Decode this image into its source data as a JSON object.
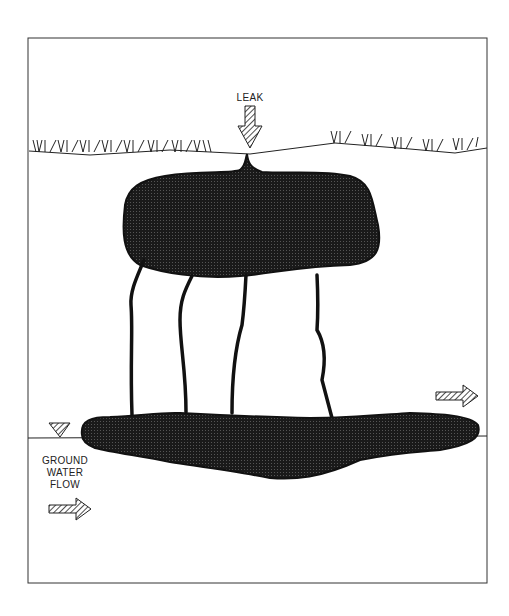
{
  "diagram": {
    "labels": {
      "leak": "LEAK",
      "ground_water_flow": [
        "GROUND",
        "WATER",
        "FLOW"
      ]
    },
    "elements": {
      "leak_arrow": "down-arrow-hatched",
      "upper_plume": "contaminant-pool-vadose-zone",
      "fingers": 4,
      "lower_plume": "contaminant-pool-water-table",
      "water_table_symbol": "inverted-triangle-hatched",
      "flow_arrows": 2
    },
    "colors": {
      "ink": "#1a1a1a",
      "background": "#ffffff"
    }
  }
}
